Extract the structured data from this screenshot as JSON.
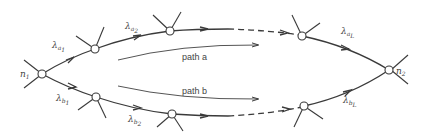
{
  "diagram": {
    "nodes": {
      "start": {
        "label": "n",
        "sub": "1"
      },
      "end": {
        "label": "n",
        "sub": "2"
      }
    },
    "edge_labels": {
      "a1": {
        "label": "λ",
        "sub": "a",
        "subsub": "1"
      },
      "a2": {
        "label": "λ",
        "sub": "a",
        "subsub": "2"
      },
      "aL": {
        "label": "λ",
        "sub": "a",
        "subsub": "L"
      },
      "b1": {
        "label": "λ",
        "sub": "b",
        "subsub": "1"
      },
      "b2": {
        "label": "λ",
        "sub": "b",
        "subsub": "2"
      },
      "bL": {
        "label": "λ",
        "sub": "b",
        "subsub": "L"
      }
    },
    "paths": {
      "a": "path  a",
      "b": "path  b"
    },
    "colors": {
      "stroke": "#3a3a3a",
      "text": "#444444",
      "background": "#ffffff"
    }
  }
}
